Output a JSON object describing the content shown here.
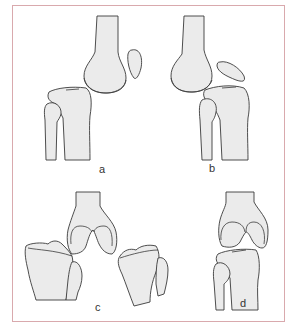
{
  "figure": {
    "panels": [
      {
        "id": "a",
        "label": "a",
        "description": "Lateral view of knee: femur, patella, tibia and fibula, joint aligned"
      },
      {
        "id": "b",
        "label": "b",
        "description": "Lateral view of knee: femur posteriorly positioned, patella tilted, tibia and fibula"
      },
      {
        "id": "c",
        "label": "c",
        "description": "Frontal view: distal femur with two tibiae angled outward on each side"
      },
      {
        "id": "d",
        "label": "d",
        "description": "Frontal view: distal femur above tibia and fibula"
      }
    ],
    "colors": {
      "border": "#d9a9ad",
      "bone_fill": "#ebebeb",
      "bone_outline": "#3a3a3a",
      "background": "#ffffff"
    }
  }
}
